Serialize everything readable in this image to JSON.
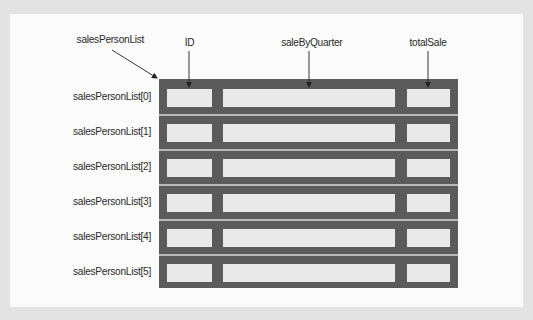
{
  "diagram": {
    "array_label": "salesPersonList",
    "field_labels": {
      "id": "ID",
      "sale_by_quarter": "saleByQuarter",
      "total_sale": "totalSale"
    },
    "rows": [
      {
        "label": "salesPersonList[0]"
      },
      {
        "label": "salesPersonList[1]"
      },
      {
        "label": "salesPersonList[2]"
      },
      {
        "label": "salesPersonList[3]"
      },
      {
        "label": "salesPersonList[4]"
      },
      {
        "label": "salesPersonList[5]"
      }
    ],
    "colors": {
      "outer_background": "#e3e3e3",
      "panel_background": "#fbfbfb",
      "table_fill": "#5b5b5b",
      "cell_fill": "#e9e9e9",
      "row_separator": "#b8b8b8",
      "text": "#2a2a2a"
    }
  }
}
